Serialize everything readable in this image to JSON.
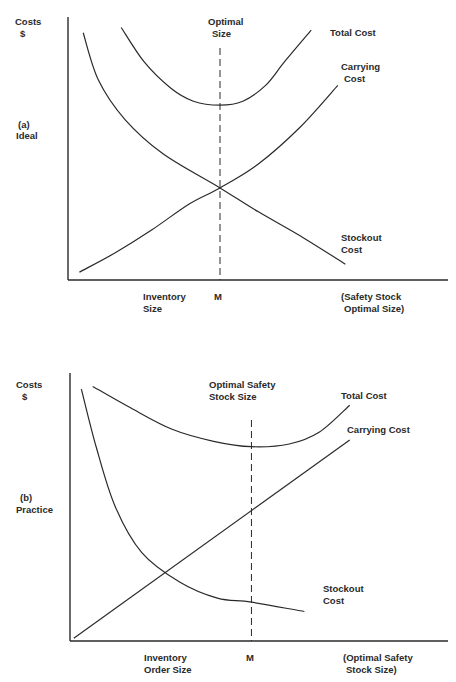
{
  "chart_data": [
    {
      "type": "line",
      "panel": "a",
      "title": "(a) Ideal",
      "panel_label": [
        "(a)",
        "Ideal"
      ],
      "ylabel": [
        "Costs",
        "$"
      ],
      "xlabel_left": [
        "Inventory",
        "Size"
      ],
      "xlabel_marker": "M",
      "xlabel_right": [
        "(Safety Stock",
        "Optimal Size)"
      ],
      "optimal_marker_label": [
        "Optimal",
        "Size"
      ],
      "optimal_x": 0.4,
      "xlim": [
        0,
        1
      ],
      "ylim": [
        0,
        1
      ],
      "grid": false,
      "series": [
        {
          "name": "Total Cost",
          "label_lines": [
            "Total Cost"
          ],
          "points": [
            [
              0.14,
              0.96
            ],
            [
              0.2,
              0.83
            ],
            [
              0.27,
              0.73
            ],
            [
              0.33,
              0.68
            ],
            [
              0.4,
              0.665
            ],
            [
              0.46,
              0.68
            ],
            [
              0.52,
              0.74
            ],
            [
              0.57,
              0.83
            ],
            [
              0.64,
              0.95
            ]
          ]
        },
        {
          "name": "Carrying Cost",
          "label_lines": [
            "Carrying",
            "Cost"
          ],
          "points": [
            [
              0.03,
              0.03
            ],
            [
              0.12,
              0.1
            ],
            [
              0.22,
              0.19
            ],
            [
              0.32,
              0.29
            ],
            [
              0.4,
              0.35
            ],
            [
              0.5,
              0.44
            ],
            [
              0.61,
              0.58
            ],
            [
              0.71,
              0.74
            ]
          ]
        },
        {
          "name": "Stockout Cost",
          "label_lines": [
            "Stockout",
            "Cost"
          ],
          "points": [
            [
              0.04,
              0.94
            ],
            [
              0.08,
              0.76
            ],
            [
              0.15,
              0.61
            ],
            [
              0.25,
              0.48
            ],
            [
              0.4,
              0.35
            ],
            [
              0.5,
              0.26
            ],
            [
              0.62,
              0.16
            ],
            [
              0.73,
              0.06
            ]
          ]
        }
      ]
    },
    {
      "type": "line",
      "panel": "b",
      "title": "(b) Practice",
      "panel_label": [
        "(b)",
        "Practice"
      ],
      "ylabel": [
        "Costs",
        "$"
      ],
      "xlabel_left": [
        "Inventory",
        "Order Size"
      ],
      "xlabel_marker": "M",
      "xlabel_right": [
        "(Optimal Safety",
        "Stock Size)"
      ],
      "optimal_marker_label": [
        "Optimal Safety",
        "Stock Size"
      ],
      "optimal_x": 0.48,
      "xlim": [
        0,
        1
      ],
      "ylim": [
        0,
        1
      ],
      "grid": false,
      "series": [
        {
          "name": "Total Cost",
          "label_lines": [
            "Total Cost"
          ],
          "points": [
            [
              0.06,
              0.95
            ],
            [
              0.16,
              0.87
            ],
            [
              0.27,
              0.79
            ],
            [
              0.38,
              0.745
            ],
            [
              0.48,
              0.725
            ],
            [
              0.58,
              0.735
            ],
            [
              0.66,
              0.78
            ],
            [
              0.74,
              0.88
            ]
          ]
        },
        {
          "name": "Carrying Cost",
          "label_lines": [
            "Carrying Cost"
          ],
          "points": [
            [
              0.01,
              0.01
            ],
            [
              0.74,
              0.75
            ]
          ]
        },
        {
          "name": "Stockout Cost",
          "label_lines": [
            "Stockout",
            "Cost"
          ],
          "points": [
            [
              0.03,
              0.94
            ],
            [
              0.07,
              0.72
            ],
            [
              0.12,
              0.5
            ],
            [
              0.19,
              0.33
            ],
            [
              0.29,
              0.22
            ],
            [
              0.39,
              0.16
            ],
            [
              0.48,
              0.145
            ],
            [
              0.62,
              0.11
            ]
          ]
        }
      ]
    }
  ]
}
